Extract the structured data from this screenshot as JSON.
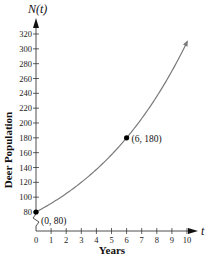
{
  "chart_data": {
    "type": "line",
    "title": "",
    "y_axis_var": "N(t)",
    "x_axis_var": "t",
    "xlabel": "Years",
    "ylabel": "Deer Population",
    "x_ticks": [
      0,
      1,
      2,
      3,
      4,
      5,
      6,
      7,
      8,
      9,
      10
    ],
    "y_ticks": [
      80,
      100,
      120,
      140,
      160,
      180,
      200,
      220,
      240,
      260,
      280,
      300,
      320
    ],
    "xlim": [
      0,
      10
    ],
    "ylim": [
      80,
      320
    ],
    "y_axis_break": true,
    "grid": false,
    "series": [
      {
        "name": "N(t) = 80(2.25)^(t/6)",
        "x": [
          0,
          1,
          2,
          3,
          4,
          5,
          6,
          7,
          8,
          9,
          10
        ],
        "values": [
          80,
          91.5,
          104.8,
          120,
          137.3,
          157.2,
          180,
          206,
          235.9,
          270,
          309
        ]
      }
    ],
    "points": [
      {
        "x": 0,
        "y": 80,
        "label": "(0, 80)"
      },
      {
        "x": 6,
        "y": 180,
        "label": "(6, 180)"
      }
    ],
    "colors": {
      "curve": "#7a7a7a",
      "axis": "#222222",
      "point": "#000000"
    }
  }
}
